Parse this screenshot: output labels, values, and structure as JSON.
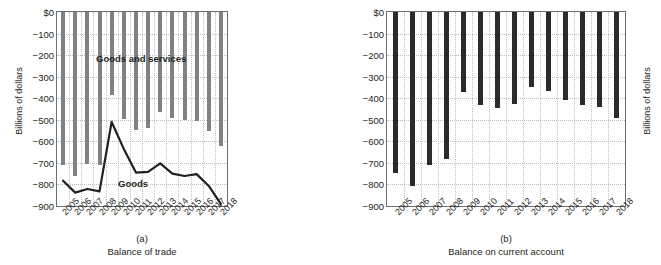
{
  "chart_data": [
    {
      "type": "bar",
      "panel": "(a)",
      "title": "Balance of trade",
      "xlabel": "",
      "ylabel": "Billions of dollars",
      "categories": [
        "2005",
        "2006",
        "2007",
        "2008",
        "2009",
        "2010",
        "2011",
        "2012",
        "2013",
        "2014",
        "2015",
        "2016",
        "2017",
        "2018"
      ],
      "ylim": [
        -900,
        0
      ],
      "yticks": [
        "$0",
        "−100",
        "−200",
        "−300",
        "−400",
        "−500",
        "−600",
        "−700",
        "−800",
        "−900"
      ],
      "ytick_values": [
        0,
        -100,
        -200,
        -300,
        -400,
        -500,
        -600,
        -700,
        -800,
        -900
      ],
      "grid": true,
      "legend": "none",
      "series": [
        {
          "name": "Goods and services",
          "render": "bar",
          "color": "#808184",
          "values": [
            -708,
            -762,
            -705,
            -708,
            -384,
            -495,
            -549,
            -537,
            -462,
            -490,
            -500,
            -504,
            -552,
            -621
          ]
        },
        {
          "name": "Goods",
          "render": "line",
          "color": "#231f20",
          "values": [
            -783,
            -838,
            -821,
            -832,
            -510,
            -635,
            -745,
            -742,
            -702,
            -750,
            -761,
            -752,
            -807,
            -891
          ]
        }
      ]
    },
    {
      "type": "bar",
      "panel": "(b)",
      "title": "Balance on current account",
      "xlabel": "",
      "ylabel": "Billions of dollars",
      "categories": [
        "2005",
        "2006",
        "2007",
        "2008",
        "2009",
        "2010",
        "2011",
        "2012",
        "2013",
        "2014",
        "2015",
        "2016",
        "2017",
        "2018"
      ],
      "ylim": [
        -900,
        0
      ],
      "yticks": [
        "$0",
        "−100",
        "−200",
        "−300",
        "−400",
        "−500",
        "−600",
        "−700",
        "−800",
        "−900"
      ],
      "ytick_values": [
        0,
        -100,
        -200,
        -300,
        -400,
        -500,
        -600,
        -700,
        -800,
        -900
      ],
      "grid": true,
      "legend": "none",
      "series": [
        {
          "name": "Balance on current account",
          "render": "bar",
          "color": "#2b2b2b",
          "values": [
            -745,
            -806,
            -711,
            -682,
            -372,
            -431,
            -446,
            -427,
            -349,
            -365,
            -408,
            -433,
            -439,
            -491
          ]
        }
      ]
    }
  ],
  "panel_a": {
    "ylabel": "Billions of dollars",
    "panel_letter": "(a)",
    "caption": "Balance of trade",
    "label_bars": "Goods and services",
    "label_line": "Goods"
  },
  "panel_b": {
    "ylabel": "Billions of dollars",
    "panel_letter": "(b)",
    "caption": "Balance on current account"
  }
}
